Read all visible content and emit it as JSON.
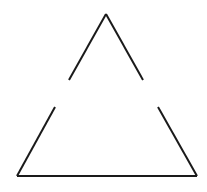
{
  "diagram": {
    "type": "broken-triangle",
    "stroke_color": "#1a1a1a",
    "background": "#ffffff",
    "segments": [
      {
        "name": "upper-left-edge",
        "x1": 106,
        "y1": 14,
        "x2": 69,
        "y2": 80
      },
      {
        "name": "upper-right-edge",
        "x1": 106,
        "y1": 14,
        "x2": 143,
        "y2": 80
      },
      {
        "name": "lower-left-edge",
        "x1": 55,
        "y1": 107,
        "x2": 17,
        "y2": 176
      },
      {
        "name": "lower-right-edge",
        "x1": 158,
        "y1": 107,
        "x2": 197,
        "y2": 176
      },
      {
        "name": "base-edge",
        "x1": 17,
        "y1": 176,
        "x2": 197,
        "y2": 176
      }
    ]
  }
}
